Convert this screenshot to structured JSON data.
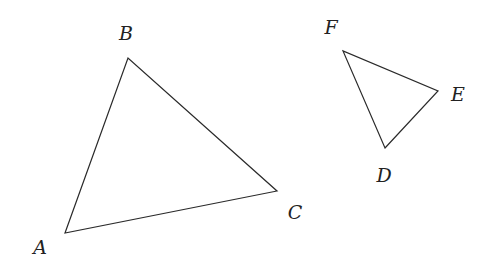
{
  "diagram": {
    "triangles": [
      {
        "name": "ABC",
        "vertices": [
          {
            "label": "A",
            "x": 65,
            "y": 233,
            "lx": 40,
            "ly": 254
          },
          {
            "label": "B",
            "x": 128,
            "y": 58,
            "lx": 126,
            "ly": 40
          },
          {
            "label": "C",
            "x": 277,
            "y": 191,
            "lx": 295,
            "ly": 219
          }
        ]
      },
      {
        "name": "DEF",
        "vertices": [
          {
            "label": "D",
            "x": 385,
            "y": 148,
            "lx": 384,
            "ly": 182
          },
          {
            "label": "E",
            "x": 438,
            "y": 91,
            "lx": 458,
            "ly": 101
          },
          {
            "label": "F",
            "x": 343,
            "y": 51,
            "lx": 331,
            "ly": 34
          }
        ]
      }
    ],
    "colors": {
      "stroke": "#2a2a2a",
      "text": "#222222",
      "background": "#ffffff"
    }
  }
}
